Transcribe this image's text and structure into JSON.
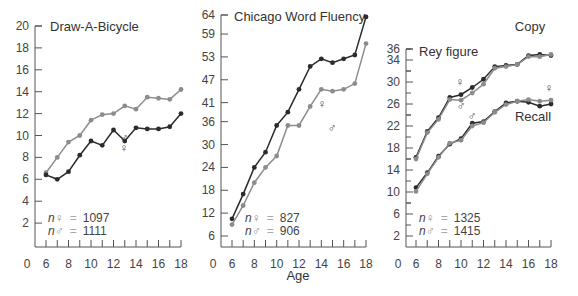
{
  "xlabel": "Age",
  "symbols": {
    "female": "♀",
    "male": "♂"
  },
  "colors": {
    "female": "#2b2b2b",
    "male": "#8c8c8c",
    "axis": "#555555"
  },
  "chart_data": [
    {
      "type": "line",
      "title": "Draw-A-Bicycle",
      "xlabel": "",
      "ylabel": "",
      "x": [
        6,
        7,
        8,
        9,
        10,
        11,
        12,
        13,
        14,
        15,
        16,
        17,
        18
      ],
      "xticks": [
        0,
        6,
        8,
        10,
        12,
        14,
        16,
        18
      ],
      "yticks": [
        2,
        4,
        6,
        8,
        10,
        12,
        14,
        16,
        18,
        20
      ],
      "ylim": [
        0,
        20
      ],
      "series": [
        {
          "name": "♂",
          "values": [
            6.6,
            8.0,
            9.4,
            10.0,
            11.4,
            11.9,
            12.0,
            12.7,
            12.4,
            13.5,
            13.4,
            13.3,
            14.2
          ]
        },
        {
          "name": "♀",
          "values": [
            6.4,
            6.0,
            6.7,
            8.2,
            9.5,
            9.1,
            10.5,
            9.5,
            10.7,
            10.6,
            10.6,
            10.8,
            12.0
          ]
        }
      ],
      "annotations": [
        "n♀ = 1097",
        "n♂ = 1111"
      ],
      "n_female": "1097",
      "n_male": "1111"
    },
    {
      "type": "line",
      "title": "Chicago Word Fluency",
      "xlabel": "Age",
      "ylabel": "",
      "x": [
        6,
        7,
        8,
        9,
        10,
        11,
        12,
        13,
        14,
        15,
        16,
        17,
        18
      ],
      "xticks": [
        0,
        6,
        8,
        10,
        12,
        14,
        16,
        18
      ],
      "yticks": [
        6,
        12,
        18,
        24,
        30,
        36,
        41,
        47,
        53,
        59,
        64
      ],
      "ylim": [
        3,
        64
      ],
      "series": [
        {
          "name": "♀",
          "values": [
            10.5,
            17.0,
            24.0,
            28.0,
            35.0,
            38.5,
            44.5,
            50.5,
            52.5,
            51.5,
            52.5,
            53.5,
            63.5
          ]
        },
        {
          "name": "♂",
          "values": [
            9.0,
            14.0,
            20.0,
            24.0,
            27.0,
            35.0,
            35.0,
            40.0,
            44.5,
            44.0,
            44.5,
            46.0,
            56.5
          ]
        }
      ],
      "annotations": [
        "n♀ = 827",
        "n♂ = 906"
      ],
      "n_female": "827",
      "n_male": "906"
    },
    {
      "type": "line",
      "title": "Rey figure",
      "xlabel": "",
      "ylabel": "",
      "x": [
        6,
        7,
        8,
        9,
        10,
        11,
        12,
        13,
        14,
        15,
        16,
        17,
        18
      ],
      "xticks": [
        0,
        6,
        8,
        10,
        12,
        14,
        16,
        18
      ],
      "yticks": [
        2,
        6,
        10,
        14,
        18,
        22,
        26,
        30,
        34,
        36
      ],
      "ylim": [
        0,
        36
      ],
      "series": [
        {
          "name": "Copy ♀",
          "values": [
            16.3,
            21.0,
            23.5,
            27.2,
            27.7,
            29.0,
            30.5,
            32.8,
            33.0,
            33.2,
            34.8,
            35.0,
            34.8
          ]
        },
        {
          "name": "Copy ♂",
          "values": [
            16.0,
            20.8,
            23.2,
            26.8,
            26.7,
            28.0,
            29.6,
            32.5,
            32.8,
            33.2,
            34.6,
            34.6,
            35.0
          ]
        },
        {
          "name": "Recall ♀",
          "values": [
            10.8,
            13.5,
            16.5,
            18.7,
            19.7,
            22.5,
            22.8,
            24.6,
            26.2,
            26.5,
            26.3,
            25.6,
            26.0
          ]
        },
        {
          "name": "Recall ♂",
          "values": [
            10.1,
            13.3,
            16.3,
            18.9,
            19.4,
            22.0,
            22.6,
            24.5,
            25.9,
            26.5,
            26.8,
            26.5,
            26.7
          ]
        }
      ],
      "annotations": [
        "Copy",
        "Recall",
        "n♀ = 1325",
        "n♂ = 1415"
      ],
      "n_female": "1325",
      "n_male": "1415",
      "copy_label": "Copy",
      "recall_label": "Recall"
    }
  ]
}
